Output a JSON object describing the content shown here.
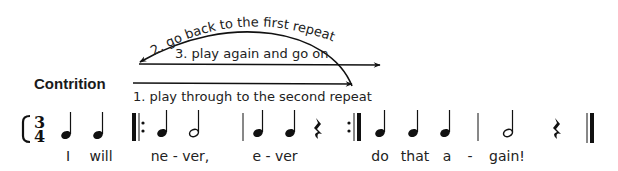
{
  "title": "Contrition",
  "annotations": {
    "step1": "1. play through to the second repeat",
    "step2": "2. go back to the first repeat",
    "step3": "3. play again and go on"
  },
  "time_signature": {
    "top": "3",
    "bottom": "4"
  },
  "notes": [
    {
      "type": "quarter",
      "x": 66,
      "lyric": "I"
    },
    {
      "type": "quarter",
      "x": 98,
      "lyric": "will"
    },
    {
      "type": "quarter",
      "x": 163,
      "lyric": "ne - ver,"
    },
    {
      "type": "half",
      "x": 196,
      "lyric": ""
    },
    {
      "type": "quarter",
      "x": 258,
      "lyric": "e - ver"
    },
    {
      "type": "quarter",
      "x": 290,
      "lyric": ""
    },
    {
      "type": "rest",
      "x": 318,
      "lyric": ""
    },
    {
      "type": "quarter",
      "x": 381,
      "lyric": "do"
    },
    {
      "type": "quarter",
      "x": 413,
      "lyric": "that"
    },
    {
      "type": "quarter",
      "x": 446,
      "lyric": "a"
    },
    {
      "type": "half",
      "x": 510,
      "lyric": "gain!"
    },
    {
      "type": "rest",
      "x": 556,
      "lyric": ""
    }
  ],
  "lyrics": [
    {
      "text": "I",
      "x": 68
    },
    {
      "text": "will",
      "x": 101
    },
    {
      "text": "ne - ver,",
      "x": 180
    },
    {
      "text": "e - ver",
      "x": 275
    },
    {
      "text": "do",
      "x": 380
    },
    {
      "text": "that",
      "x": 415
    },
    {
      "text": "a",
      "x": 447
    },
    {
      "text": "-",
      "x": 470
    },
    {
      "text": "gain!",
      "x": 507
    }
  ],
  "barlines": [
    {
      "type": "start-repeat",
      "x": 133
    },
    {
      "type": "single",
      "x": 243
    },
    {
      "type": "end-repeat",
      "x": 360
    },
    {
      "type": "single",
      "x": 478
    },
    {
      "type": "final",
      "x": 592
    }
  ]
}
